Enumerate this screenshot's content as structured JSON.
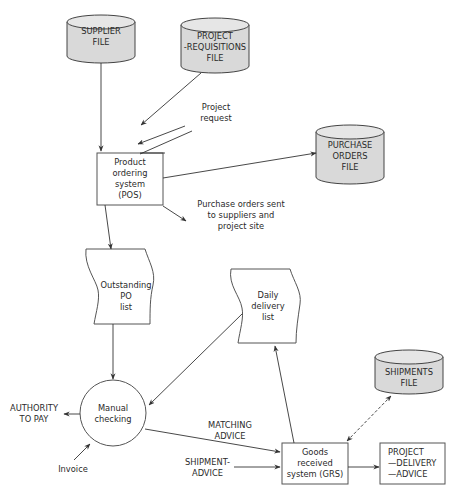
{
  "diagram": {
    "type": "system flowchart",
    "colors": {
      "line": "#333333",
      "file_fill": "#d9d9d9",
      "box_fill": "#ffffff"
    },
    "files": {
      "supplier": "SUPPLIER\nFILE",
      "project_requisitions": "PROJECT\n-REQUISITIONS\nFILE",
      "purchase_orders": "PURCHASE\nORDERS\nFILE",
      "shipments": "SHIPMENTS\nFILE"
    },
    "processes": {
      "pos": "Product\nordering\nsystem\n(POS)",
      "grs": "Goods\nreceived\nsystem (GRS)",
      "manual_checking": "Manual\nchecking"
    },
    "documents": {
      "outstanding_po": "Outstanding\nPO\nlist",
      "daily_delivery": "Daily\ndelivery\nlist"
    },
    "outputs": {
      "project_delivery_advice": "PROJECT\n—DELIVERY\n—ADVICE",
      "authority_to_pay": "AUTHORITY\nTO PAY"
    },
    "flow_labels": {
      "project_request": "Project\nrequest",
      "purchase_orders_sent": "Purchase orders sent\nto suppliers and\nproject site",
      "matching_advice": "MATCHING\nADVICE",
      "shipment_advice": "SHIPMENT-\nADVICE",
      "invoice": "Invoice"
    }
  }
}
